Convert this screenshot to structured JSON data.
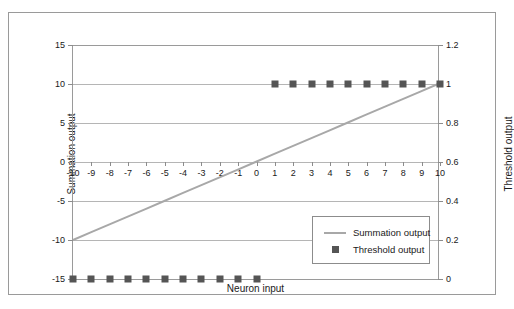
{
  "chart_data": {
    "type": "line",
    "title": "",
    "xlabel": "Neuron input",
    "ylabel": "Summation output",
    "y2label": "Threshold output",
    "xlim": [
      -10,
      10
    ],
    "ylim": [
      -15,
      15
    ],
    "y2lim": [
      0,
      1.2
    ],
    "grid": true,
    "legend_position": "inside-lower-right",
    "x": [
      -10,
      -9,
      -8,
      -7,
      -6,
      -5,
      -4,
      -3,
      -2,
      -1,
      0,
      1,
      2,
      3,
      4,
      5,
      6,
      7,
      8,
      9,
      10
    ],
    "series": [
      {
        "name": "Summation output",
        "axis": "left",
        "style": "line",
        "color": "#a8a8a8",
        "values": [
          -10,
          -9,
          -8,
          -7,
          -6,
          -5,
          -4,
          -3,
          -2,
          -1,
          0,
          1,
          2,
          3,
          4,
          5,
          6,
          7,
          8,
          9,
          10
        ]
      },
      {
        "name": "Threshold output",
        "axis": "right",
        "style": "markers",
        "marker": "square",
        "color": "#555555",
        "values": [
          0,
          0,
          0,
          0,
          0,
          0,
          0,
          0,
          0,
          0,
          0,
          1,
          1,
          1,
          1,
          1,
          1,
          1,
          1,
          1,
          1
        ]
      }
    ],
    "xticks": [
      "-10",
      "-9",
      "-8",
      "-7",
      "-6",
      "-5",
      "-4",
      "-3",
      "-2",
      "-1",
      "0",
      "1",
      "2",
      "3",
      "4",
      "5",
      "6",
      "7",
      "8",
      "9",
      "10"
    ],
    "xtick_values": [
      -10,
      -9,
      -8,
      -7,
      -6,
      -5,
      -4,
      -3,
      -2,
      -1,
      0,
      1,
      2,
      3,
      4,
      5,
      6,
      7,
      8,
      9,
      10
    ],
    "yticks_left": [
      "15",
      "10",
      "5",
      "0",
      "-5",
      "-10",
      "-15"
    ],
    "ytick_left_values": [
      15,
      10,
      5,
      0,
      -5,
      -10,
      -15
    ],
    "yticks_right": [
      "1.2",
      "1",
      "0.8",
      "0.6",
      "0.4",
      "0.2",
      "0"
    ],
    "ytick_right_values": [
      1.2,
      1,
      0.8,
      0.6,
      0.4,
      0.2,
      0
    ],
    "legend": [
      {
        "label": "Summation output",
        "key": "line",
        "color": "#a8a8a8"
      },
      {
        "label": "Threshold output",
        "key": "square",
        "color": "#555555"
      }
    ]
  },
  "axes": {
    "x_title": "Neuron input",
    "y_left_title": "Summation output",
    "y_right_title": "Threshold output"
  },
  "legend": {
    "summation_label": "Summation output",
    "threshold_label": "Threshold output"
  },
  "colors": {
    "line": "#a8a8a8",
    "marker": "#555555",
    "grid": "#b5b5b5",
    "axis": "#9a9a9a",
    "frame": "#9a9a9a",
    "text": "#1a1a1a",
    "background": "#ffffff"
  }
}
